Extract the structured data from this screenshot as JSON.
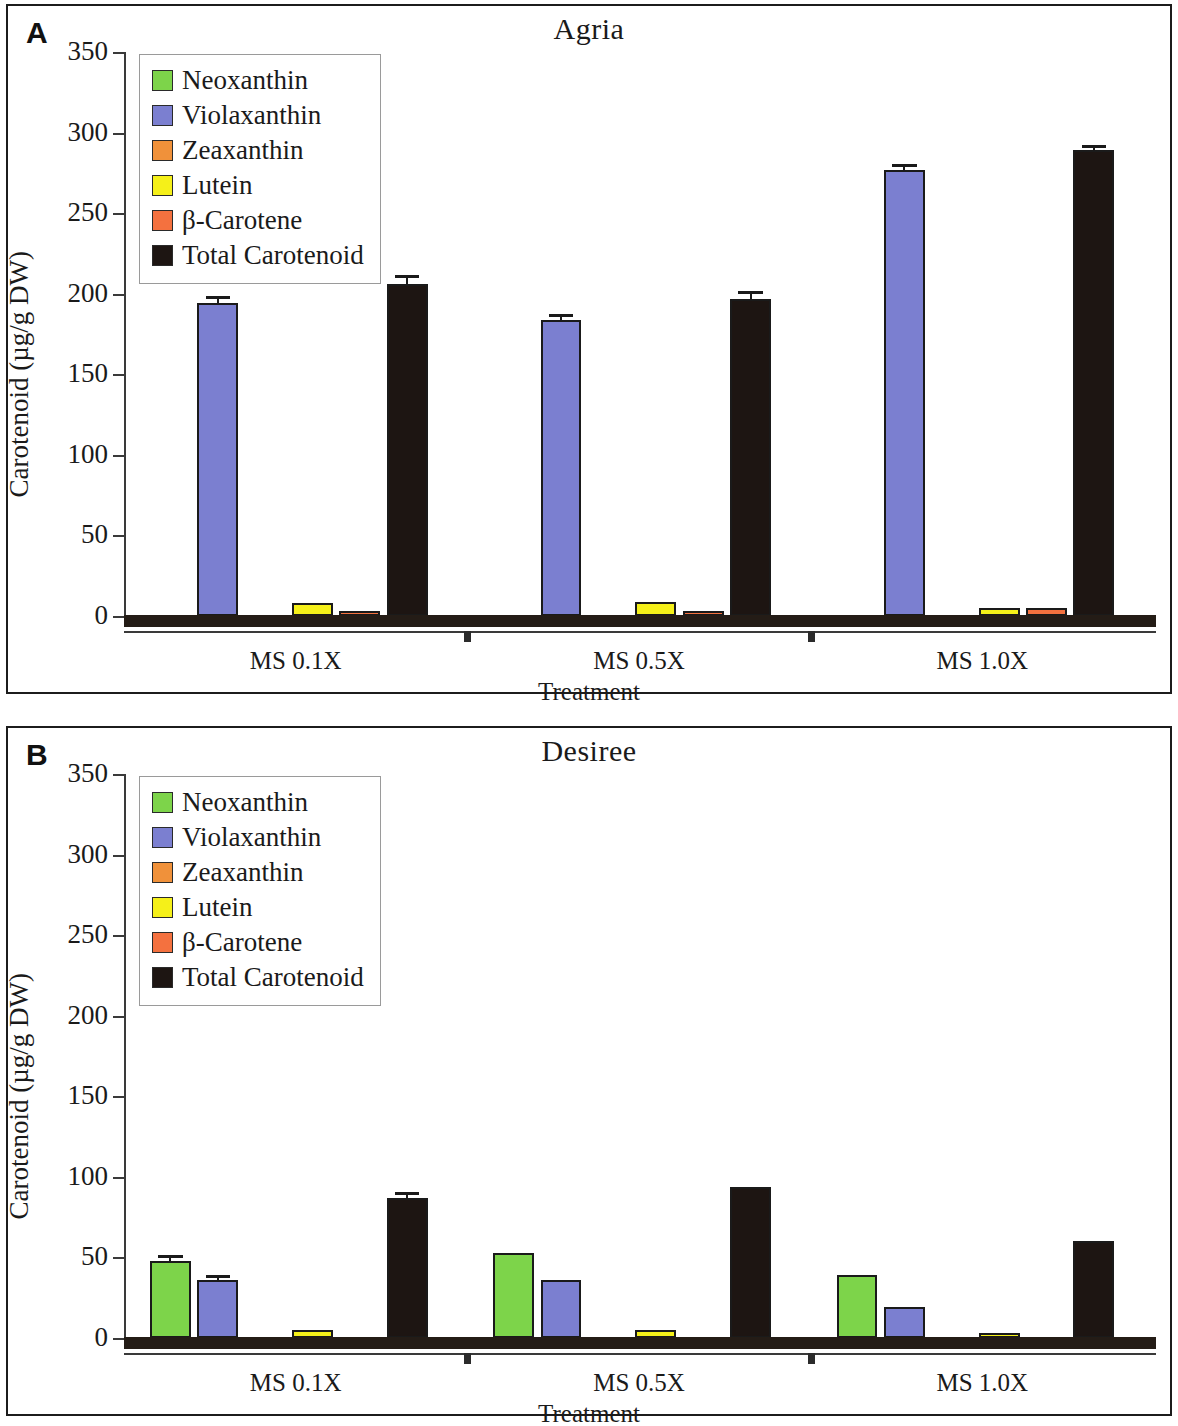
{
  "figure": {
    "panels": [
      {
        "letter": "A",
        "title": "Agria",
        "xlabel": "Treatment",
        "ylabel": "Carotenoid (µg/g DW)",
        "categories": [
          "MS 0.1X",
          "MS 0.5X",
          "MS 1.0X"
        ]
      },
      {
        "letter": "B",
        "title": "Desiree",
        "xlabel": "Treatment",
        "ylabel": "Carotenoid (µg/g DW)",
        "categories": [
          "MS 0.1X",
          "MS 0.5X",
          "MS 1.0X"
        ]
      }
    ],
    "legend": {
      "items": [
        {
          "label": "Neoxanthin",
          "color": "#7dd44a"
        },
        {
          "label": "Violaxanthin",
          "color": "#7b7fd0"
        },
        {
          "label": "Zeaxanthin",
          "color": "#f0913a"
        },
        {
          "label": "Lutein",
          "color": "#f5f019"
        },
        {
          "label": "β-Carotene",
          "color": "#f4713f"
        },
        {
          "label": "Total Carotenoid",
          "color": "#1d1512"
        }
      ]
    },
    "yticks": [
      "0",
      "50",
      "100",
      "150",
      "200",
      "250",
      "300",
      "350"
    ]
  },
  "chart_data": [
    {
      "type": "bar",
      "title": "Agria",
      "panel": "A",
      "xlabel": "Treatment",
      "ylabel": "Carotenoid (µg/g DW)",
      "ylim": [
        0,
        350
      ],
      "ytick_step": 50,
      "grid": false,
      "legend_position": "upper-left",
      "categories": [
        "MS 0.1X",
        "MS 0.5X",
        "MS 1.0X"
      ],
      "series": [
        {
          "name": "Neoxanthin",
          "color": "#7dd44a",
          "values": [
            0,
            0,
            0
          ],
          "errors": [
            0,
            0,
            0
          ]
        },
        {
          "name": "Violaxanthin",
          "color": "#7b7fd0",
          "values": [
            194,
            184,
            277
          ],
          "errors": [
            2.5,
            1.5,
            1.5
          ]
        },
        {
          "name": "Zeaxanthin",
          "color": "#f0913a",
          "values": [
            0,
            0,
            0
          ],
          "errors": [
            0,
            0,
            0
          ]
        },
        {
          "name": "Lutein",
          "color": "#f5f019",
          "values": [
            8,
            8.5,
            5
          ],
          "errors": [
            0,
            0,
            0
          ]
        },
        {
          "name": "β-Carotene",
          "color": "#f4713f",
          "values": [
            3,
            3,
            5
          ],
          "errors": [
            0,
            0,
            0
          ]
        },
        {
          "name": "Total Carotenoid",
          "color": "#1d1512",
          "values": [
            206,
            197,
            289
          ],
          "errors": [
            3.5,
            3,
            1.5
          ]
        }
      ]
    },
    {
      "type": "bar",
      "title": "Desiree",
      "panel": "B",
      "xlabel": "Treatment",
      "ylabel": "Carotenoid (µg/g DW)",
      "ylim": [
        0,
        350
      ],
      "ytick_step": 50,
      "grid": false,
      "legend_position": "upper-left",
      "categories": [
        "MS 0.1X",
        "MS 0.5X",
        "MS 1.0X"
      ],
      "series": [
        {
          "name": "Neoxanthin",
          "color": "#7dd44a",
          "values": [
            48,
            53,
            39
          ],
          "errors": [
            1.5,
            0,
            0
          ]
        },
        {
          "name": "Violaxanthin",
          "color": "#7b7fd0",
          "values": [
            36,
            36,
            19
          ],
          "errors": [
            1,
            0,
            0
          ]
        },
        {
          "name": "Zeaxanthin",
          "color": "#f0913a",
          "values": [
            0,
            0,
            0
          ],
          "errors": [
            0,
            0,
            0
          ]
        },
        {
          "name": "Lutein",
          "color": "#f5f019",
          "values": [
            5,
            5,
            2
          ],
          "errors": [
            0,
            0,
            0
          ]
        },
        {
          "name": "β-Carotene",
          "color": "#f4713f",
          "values": [
            0,
            0,
            0
          ],
          "errors": [
            0,
            0,
            0
          ]
        },
        {
          "name": "Total Carotenoid",
          "color": "#1d1512",
          "values": [
            87,
            94,
            60
          ],
          "errors": [
            2,
            0,
            0
          ]
        }
      ]
    }
  ]
}
